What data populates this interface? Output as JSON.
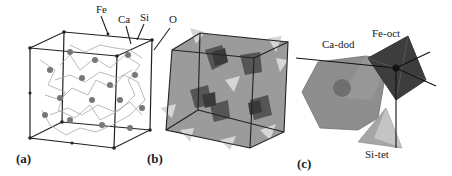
{
  "figure": {
    "panels": [
      {
        "id": "a",
        "label": "(a)",
        "description": "ball-and-stick unit cell",
        "atom_labels": [
          "Fe",
          "Ca",
          "Si",
          "O"
        ]
      },
      {
        "id": "b",
        "label": "(b)",
        "description": "polyhedral unit cell"
      },
      {
        "id": "c",
        "label": "(c)",
        "description": "coordination polyhedra",
        "polyhedra_labels": [
          "Ca-dod",
          "Fe-oct",
          "Si-tet"
        ]
      }
    ]
  }
}
